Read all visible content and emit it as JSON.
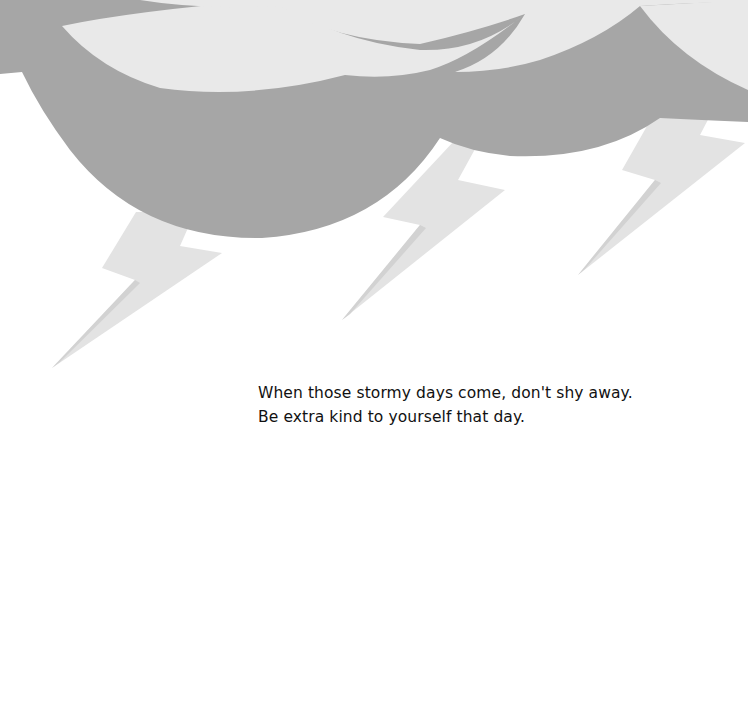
{
  "page": {
    "type": "illustrated-book-page",
    "illustration": {
      "subject": "storm-cloud-with-lightning",
      "bolt_count": 3,
      "colors": {
        "background": "#ffffff",
        "sky": "#e9e9e9",
        "cloud": "#a6a6a6",
        "bolt": "#e3e3e3",
        "bolt_shadow": "#d2d2d2",
        "text": "#111111"
      }
    },
    "caption": {
      "lines": [
        "When those stormy days come, don't shy away.",
        "Be extra kind to yourself that day."
      ]
    }
  }
}
